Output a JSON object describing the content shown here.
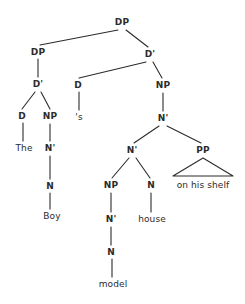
{
  "diagram": {
    "type": "constituency-tree",
    "line_color": "#2b2b2b",
    "text_color": "#2b2b2b",
    "background_color": "#ffffff",
    "nodes": [
      {
        "id": "dp-root",
        "label": "DP",
        "kind": "category",
        "x": 122,
        "y": 22
      },
      {
        "id": "dp-left",
        "label": "DP",
        "kind": "category",
        "x": 38,
        "y": 52
      },
      {
        "id": "dbar-right",
        "label": "D'",
        "kind": "category",
        "x": 150,
        "y": 54
      },
      {
        "id": "dbar-left",
        "label": "D'",
        "kind": "category",
        "x": 38,
        "y": 84
      },
      {
        "id": "d-poss",
        "label": "D",
        "kind": "category",
        "x": 78,
        "y": 85
      },
      {
        "id": "np-right",
        "label": "NP",
        "kind": "category",
        "x": 163,
        "y": 85
      },
      {
        "id": "d-the",
        "label": "D",
        "kind": "category",
        "x": 22,
        "y": 116
      },
      {
        "id": "np-left",
        "label": "NP",
        "kind": "category",
        "x": 50,
        "y": 116
      },
      {
        "id": "nbar-top",
        "label": "N'",
        "kind": "category",
        "x": 163,
        "y": 118
      },
      {
        "id": "the",
        "label": "The",
        "kind": "word",
        "x": 24,
        "y": 148
      },
      {
        "id": "nbar-left",
        "label": "N'",
        "kind": "category",
        "x": 50,
        "y": 148
      },
      {
        "id": "poss-s",
        "label": "'s",
        "kind": "word",
        "x": 79,
        "y": 117
      },
      {
        "id": "nbar-mid",
        "label": "N'",
        "kind": "category",
        "x": 132,
        "y": 150
      },
      {
        "id": "pp",
        "label": "PP",
        "kind": "category",
        "x": 203,
        "y": 150
      },
      {
        "id": "n-boy",
        "label": "N",
        "kind": "category",
        "x": 50,
        "y": 186
      },
      {
        "id": "np-model",
        "label": "NP",
        "kind": "category",
        "x": 111,
        "y": 185
      },
      {
        "id": "n-house",
        "label": "N",
        "kind": "category",
        "x": 151,
        "y": 185
      },
      {
        "id": "pp-text",
        "label": "on his shelf",
        "kind": "word",
        "x": 203,
        "y": 185
      },
      {
        "id": "boy",
        "label": "Boy",
        "kind": "word",
        "x": 52,
        "y": 216
      },
      {
        "id": "nbar-model",
        "label": "N'",
        "kind": "category",
        "x": 111,
        "y": 219
      },
      {
        "id": "house",
        "label": "house",
        "kind": "word",
        "x": 152,
        "y": 219
      },
      {
        "id": "n-model",
        "label": "N",
        "kind": "category",
        "x": 111,
        "y": 252
      },
      {
        "id": "model",
        "label": "model",
        "kind": "word",
        "x": 113,
        "y": 284
      }
    ],
    "edges": [
      {
        "from": "dp-root",
        "to": "dp-left",
        "x1": 118,
        "y1": 30,
        "x2": 40,
        "y2": 45
      },
      {
        "from": "dp-root",
        "to": "dbar-right",
        "x1": 126,
        "y1": 30,
        "x2": 148,
        "y2": 47
      },
      {
        "from": "dp-left",
        "to": "dbar-left",
        "x1": 38,
        "y1": 59,
        "x2": 38,
        "y2": 77
      },
      {
        "from": "dbar-right",
        "to": "d-poss",
        "x1": 146,
        "y1": 62,
        "x2": 79,
        "y2": 78
      },
      {
        "from": "dbar-right",
        "to": "np-right",
        "x1": 153,
        "y1": 62,
        "x2": 162,
        "y2": 78
      },
      {
        "from": "dbar-left",
        "to": "d-the",
        "x1": 35,
        "y1": 92,
        "x2": 22,
        "y2": 109
      },
      {
        "from": "dbar-left",
        "to": "np-left",
        "x1": 41,
        "y1": 92,
        "x2": 50,
        "y2": 109
      },
      {
        "from": "d-poss",
        "to": "poss-s",
        "x1": 79,
        "y1": 92,
        "x2": 79,
        "y2": 110
      },
      {
        "from": "np-right",
        "to": "nbar-top",
        "x1": 163,
        "y1": 93,
        "x2": 163,
        "y2": 111
      },
      {
        "from": "d-the",
        "to": "the",
        "x1": 23,
        "y1": 123,
        "x2": 23,
        "y2": 141
      },
      {
        "from": "np-left",
        "to": "nbar-left",
        "x1": 50,
        "y1": 124,
        "x2": 50,
        "y2": 141
      },
      {
        "from": "nbar-top",
        "to": "nbar-mid",
        "x1": 159,
        "y1": 126,
        "x2": 134,
        "y2": 143
      },
      {
        "from": "nbar-top",
        "to": "pp",
        "x1": 167,
        "y1": 126,
        "x2": 201,
        "y2": 143
      },
      {
        "from": "nbar-left",
        "to": "n-boy",
        "x1": 50,
        "y1": 156,
        "x2": 50,
        "y2": 179
      },
      {
        "from": "nbar-mid",
        "to": "np-model",
        "x1": 129,
        "y1": 158,
        "x2": 112,
        "y2": 178
      },
      {
        "from": "nbar-mid",
        "to": "n-house",
        "x1": 136,
        "y1": 158,
        "x2": 150,
        "y2": 178
      },
      {
        "from": "n-boy",
        "to": "boy",
        "x1": 50,
        "y1": 193,
        "x2": 50,
        "y2": 209
      },
      {
        "from": "np-model",
        "to": "nbar-model",
        "x1": 111,
        "y1": 193,
        "x2": 111,
        "y2": 212
      },
      {
        "from": "n-house",
        "to": "house",
        "x1": 151,
        "y1": 193,
        "x2": 151,
        "y2": 212
      },
      {
        "from": "nbar-model",
        "to": "n-model",
        "x1": 111,
        "y1": 227,
        "x2": 111,
        "y2": 245
      },
      {
        "from": "n-model",
        "to": "model",
        "x1": 112,
        "y1": 259,
        "x2": 112,
        "y2": 277
      }
    ],
    "triangles": [
      {
        "from": "pp",
        "to": "pp-text",
        "apex_x": 203,
        "apex_y": 158,
        "left_x": 173,
        "right_x": 233,
        "base_y": 176
      }
    ],
    "sentence_words": [
      "The",
      "Boy",
      "'s",
      "model",
      "house",
      "on his shelf"
    ]
  }
}
